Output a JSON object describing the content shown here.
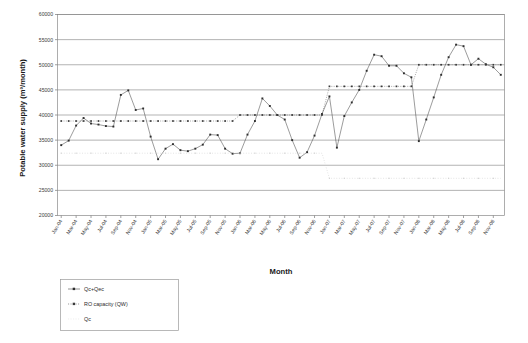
{
  "chart_data": {
    "type": "line",
    "title": "",
    "xlabel": "Month",
    "ylabel": "Potable water supply (m³/month)",
    "ylim": [
      20000,
      60000
    ],
    "ytick_step": 5000,
    "yticks": [
      "20000",
      "25000",
      "30000",
      "35000",
      "40000",
      "45000",
      "50000",
      "55000",
      "60000"
    ],
    "grid": true,
    "legend_position": "below-left",
    "x": [
      "Jan-04",
      "Feb-04",
      "Mar-04",
      "Apr-04",
      "May-04",
      "Jun-04",
      "Jul-04",
      "Aug-04",
      "Sep-04",
      "Oct-04",
      "Nov-04",
      "Dec-04",
      "Jan-05",
      "Feb-05",
      "Mar-05",
      "Apr-05",
      "May-05",
      "Jun-05",
      "Jul-05",
      "Aug-05",
      "Sep-05",
      "Oct-05",
      "Nov-05",
      "Dec-05",
      "Jan-06",
      "Feb-06",
      "Mar-06",
      "Apr-06",
      "May-06",
      "Jun-06",
      "Jul-06",
      "Aug-06",
      "Sep-06",
      "Oct-06",
      "Nov-06",
      "Dec-06",
      "Jan-07",
      "Feb-07",
      "Mar-07",
      "Apr-07",
      "May-07",
      "Jun-07",
      "Jul-07",
      "Aug-07",
      "Sep-07",
      "Oct-07",
      "Nov-07",
      "Dec-07",
      "Jan-08",
      "Feb-08",
      "Mar-08",
      "Apr-08",
      "May-08",
      "Jun-08",
      "Jul-08",
      "Aug-08",
      "Sep-08",
      "Oct-08",
      "Nov-08",
      "Dec-08"
    ],
    "xticks_shown": [
      "Jan-04",
      "Mar-04",
      "May-04",
      "Jul-04",
      "Sep-04",
      "Nov-04",
      "Jan-05",
      "Mar-05",
      "May-05",
      "Jul-05",
      "Sep-05",
      "Nov-05",
      "Jan-06",
      "Mar-06",
      "May-06",
      "Jul-06",
      "Sep-06",
      "Nov-06",
      "Jan-07",
      "Mar-07",
      "May-07",
      "Jul-07",
      "Sep-07",
      "Nov-07",
      "Jan-08",
      "Mar-08",
      "May-08",
      "Jul-08",
      "Sep-08",
      "Nov-08"
    ],
    "series": [
      {
        "name": "Qc+Qec",
        "color": "#3a3a3a",
        "style": "solid-with-markers",
        "values": [
          34000,
          34900,
          37900,
          39400,
          38300,
          38100,
          37800,
          37700,
          44000,
          44900,
          41000,
          41300,
          35700,
          31200,
          33300,
          34200,
          33000,
          32800,
          33300,
          34100,
          36100,
          36000,
          33300,
          32300,
          32400,
          36100,
          38800,
          43300,
          41800,
          40000,
          39100,
          35000,
          31500,
          32600,
          35900,
          40200,
          43700,
          33500,
          39800,
          42500,
          45000,
          48800,
          52000,
          51700,
          49800,
          49800,
          48300,
          47500,
          34800,
          39100,
          43500,
          48000,
          51500,
          54000,
          53700,
          50000,
          51200,
          50100,
          49500,
          48000
        ]
      },
      {
        "name": "RO capacity (QW)",
        "color": "#3a3a3a",
        "style": "dotted-with-markers",
        "values": [
          38800,
          38800,
          38800,
          38800,
          38800,
          38800,
          38800,
          38800,
          38800,
          38800,
          38800,
          38800,
          38800,
          38800,
          38800,
          38800,
          38800,
          38800,
          38800,
          38800,
          38800,
          38800,
          38800,
          38800,
          40000,
          40000,
          40000,
          40000,
          40000,
          40000,
          40000,
          40000,
          40000,
          40000,
          40000,
          40000,
          45700,
          45700,
          45700,
          45700,
          45700,
          45700,
          45700,
          45700,
          45700,
          45700,
          45700,
          45700,
          50000,
          50000,
          50000,
          50000,
          50000,
          50000,
          50000,
          50000,
          50000,
          50000,
          50000,
          50000
        ]
      },
      {
        "name": "Qc",
        "color": "#d0d0d0",
        "style": "dotted-faint",
        "values": [
          32400,
          32400,
          32400,
          32400,
          32400,
          32400,
          32400,
          32400,
          32400,
          32400,
          32400,
          32400,
          32400,
          32400,
          32400,
          32400,
          32400,
          32400,
          32400,
          32400,
          32400,
          32400,
          32400,
          32400,
          32400,
          32400,
          32400,
          32400,
          32400,
          32400,
          32400,
          32400,
          32400,
          32400,
          32400,
          32400,
          27400,
          27400,
          27400,
          27400,
          27400,
          27400,
          27400,
          27400,
          27400,
          27400,
          27400,
          27400,
          27400,
          27400,
          27400,
          27400,
          27400,
          27400,
          27400,
          27400,
          27400,
          27400,
          27400,
          27400
        ]
      }
    ]
  },
  "legend": {
    "entries": [
      {
        "label": "Qc+Qec"
      },
      {
        "label": "RO capacity (QW)"
      },
      {
        "label": "Qc"
      }
    ]
  },
  "axes": {
    "y_title": "Potable water supply (m³/month)",
    "x_title": "Month"
  }
}
